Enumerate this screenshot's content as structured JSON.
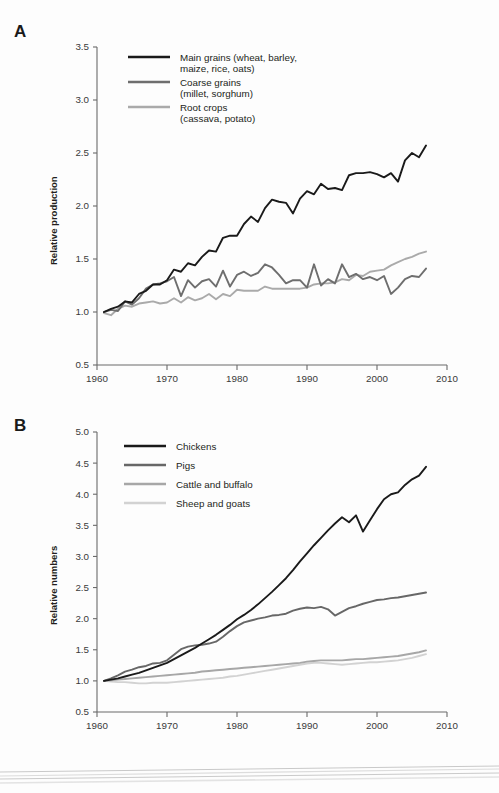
{
  "figure": {
    "background_color": "#fdfdfd",
    "panels": [
      "A",
      "B"
    ]
  },
  "panel_a": {
    "letter": "A",
    "y_axis_label": "Relative production",
    "legend_entries": [
      {
        "label_line1": "Main grains (wheat, barley,",
        "label_line2": "maize, rice, oats)",
        "color": "#1a1a1a"
      },
      {
        "label_line1": "Coarse grains",
        "label_line2": "(millet, sorghum)",
        "color": "#6e6e6e"
      },
      {
        "label_line1": "Root crops",
        "label_line2": "(cassava, potato)",
        "color": "#aaaaaa"
      }
    ]
  },
  "panel_b": {
    "letter": "B",
    "y_axis_label": "Relative numbers",
    "legend_entries": [
      {
        "label": "Chickens",
        "color": "#1a1a1a"
      },
      {
        "label": "Pigs",
        "color": "#676767"
      },
      {
        "label": "Cattle and buffalo",
        "color": "#a7a7a7"
      },
      {
        "label": "Sheep and goats",
        "color": "#d2d2d2"
      }
    ]
  },
  "chart_data": [
    {
      "type": "line",
      "id": "panel-a",
      "title": "",
      "xlabel": "",
      "ylabel": "Relative production",
      "xlim": [
        1960,
        2010
      ],
      "ylim": [
        0.5,
        3.5
      ],
      "xticks": [
        1960,
        1970,
        1980,
        1990,
        2000,
        2010
      ],
      "yticks": [
        0.5,
        1.0,
        1.5,
        2.0,
        2.5,
        3.0,
        3.5
      ],
      "xtick_labels": [
        "1960",
        "1970",
        "1980",
        "1990",
        "2000",
        "2010"
      ],
      "ytick_labels": [
        "0.5",
        "1.0",
        "1.5",
        "2.0",
        "2.5",
        "3.0",
        "3.5"
      ],
      "grid": false,
      "legend_position": "upper-left-inside",
      "x": [
        1961,
        1962,
        1963,
        1964,
        1965,
        1966,
        1967,
        1968,
        1969,
        1970,
        1971,
        1972,
        1973,
        1974,
        1975,
        1976,
        1977,
        1978,
        1979,
        1980,
        1981,
        1982,
        1983,
        1984,
        1985,
        1986,
        1987,
        1988,
        1989,
        1990,
        1991,
        1992,
        1993,
        1994,
        1995,
        1996,
        1997,
        1998,
        1999,
        2000,
        2001,
        2002,
        2003,
        2004,
        2005,
        2006,
        2007
      ],
      "series": [
        {
          "name": "Main grains (wheat, barley, maize, rice, oats)",
          "color": "#1a1a1a",
          "values": [
            1.0,
            1.03,
            1.05,
            1.1,
            1.09,
            1.17,
            1.2,
            1.26,
            1.26,
            1.3,
            1.4,
            1.38,
            1.46,
            1.44,
            1.52,
            1.58,
            1.57,
            1.7,
            1.72,
            1.72,
            1.83,
            1.9,
            1.85,
            1.98,
            2.06,
            2.04,
            2.03,
            1.93,
            2.07,
            2.14,
            2.11,
            2.21,
            2.16,
            2.17,
            2.15,
            2.29,
            2.31,
            2.31,
            2.32,
            2.3,
            2.27,
            2.31,
            2.23,
            2.43,
            2.5,
            2.46,
            2.57
          ]
        },
        {
          "name": "Coarse grains (millet, sorghum)",
          "color": "#6e6e6e",
          "values": [
            1.0,
            1.02,
            1.01,
            1.1,
            1.07,
            1.13,
            1.22,
            1.26,
            1.27,
            1.29,
            1.33,
            1.15,
            1.3,
            1.23,
            1.29,
            1.31,
            1.24,
            1.39,
            1.24,
            1.35,
            1.38,
            1.34,
            1.37,
            1.45,
            1.42,
            1.35,
            1.27,
            1.3,
            1.3,
            1.23,
            1.45,
            1.25,
            1.31,
            1.27,
            1.45,
            1.33,
            1.36,
            1.31,
            1.33,
            1.3,
            1.34,
            1.17,
            1.23,
            1.31,
            1.34,
            1.33,
            1.41
          ]
        },
        {
          "name": "Root crops (cassava, potato)",
          "color": "#aaaaaa",
          "values": [
            0.99,
            0.97,
            1.03,
            1.06,
            1.05,
            1.08,
            1.09,
            1.1,
            1.08,
            1.09,
            1.13,
            1.09,
            1.14,
            1.11,
            1.13,
            1.17,
            1.12,
            1.17,
            1.15,
            1.21,
            1.2,
            1.2,
            1.2,
            1.24,
            1.22,
            1.22,
            1.22,
            1.22,
            1.22,
            1.23,
            1.26,
            1.27,
            1.27,
            1.28,
            1.31,
            1.3,
            1.35,
            1.34,
            1.38,
            1.39,
            1.4,
            1.44,
            1.47,
            1.5,
            1.52,
            1.55,
            1.57
          ]
        }
      ]
    },
    {
      "type": "line",
      "id": "panel-b",
      "title": "",
      "xlabel": "",
      "ylabel": "Relative numbers",
      "xlim": [
        1960,
        2010
      ],
      "ylim": [
        0.5,
        5.0
      ],
      "xticks": [
        1960,
        1970,
        1980,
        1990,
        2000,
        2010
      ],
      "yticks": [
        0.5,
        1.0,
        1.5,
        2.0,
        2.5,
        3.0,
        3.5,
        4.0,
        4.5,
        5.0
      ],
      "xtick_labels": [
        "1960",
        "1970",
        "1980",
        "1990",
        "2000",
        "2010"
      ],
      "ytick_labels": [
        "0.5",
        "1.0",
        "1.5",
        "2.0",
        "2.5",
        "3.0",
        "3.5",
        "4.0",
        "4.5",
        "5.0"
      ],
      "grid": false,
      "legend_position": "upper-left-inside",
      "x": [
        1961,
        1962,
        1963,
        1964,
        1965,
        1966,
        1967,
        1968,
        1969,
        1970,
        1971,
        1972,
        1973,
        1974,
        1975,
        1976,
        1977,
        1978,
        1979,
        1980,
        1981,
        1982,
        1983,
        1984,
        1985,
        1986,
        1987,
        1988,
        1989,
        1990,
        1991,
        1992,
        1993,
        1994,
        1995,
        1996,
        1997,
        1998,
        1999,
        2000,
        2001,
        2002,
        2003,
        2004,
        2005,
        2006,
        2007
      ],
      "series": [
        {
          "name": "Chickens",
          "color": "#1a1a1a",
          "values": [
            1.0,
            1.02,
            1.04,
            1.07,
            1.1,
            1.13,
            1.17,
            1.21,
            1.25,
            1.29,
            1.35,
            1.41,
            1.47,
            1.53,
            1.6,
            1.67,
            1.74,
            1.82,
            1.9,
            1.99,
            2.06,
            2.14,
            2.23,
            2.33,
            2.43,
            2.54,
            2.65,
            2.78,
            2.92,
            3.05,
            3.18,
            3.3,
            3.42,
            3.53,
            3.63,
            3.55,
            3.66,
            3.4,
            3.58,
            3.76,
            3.92,
            4.0,
            4.03,
            4.15,
            4.24,
            4.3,
            4.44
          ]
        },
        {
          "name": "Pigs",
          "color": "#676767",
          "values": [
            1.0,
            1.04,
            1.09,
            1.15,
            1.18,
            1.22,
            1.24,
            1.28,
            1.29,
            1.33,
            1.42,
            1.51,
            1.55,
            1.57,
            1.58,
            1.6,
            1.63,
            1.71,
            1.8,
            1.88,
            1.94,
            1.97,
            2.0,
            2.02,
            2.05,
            2.06,
            2.08,
            2.13,
            2.16,
            2.18,
            2.17,
            2.19,
            2.15,
            2.05,
            2.11,
            2.17,
            2.2,
            2.24,
            2.27,
            2.3,
            2.31,
            2.33,
            2.34,
            2.36,
            2.38,
            2.4,
            2.42
          ]
        },
        {
          "name": "Cattle and buffalo",
          "color": "#a7a7a7",
          "values": [
            1.0,
            1.01,
            1.02,
            1.03,
            1.04,
            1.05,
            1.06,
            1.07,
            1.08,
            1.09,
            1.1,
            1.11,
            1.12,
            1.13,
            1.15,
            1.16,
            1.17,
            1.18,
            1.19,
            1.2,
            1.21,
            1.22,
            1.23,
            1.24,
            1.25,
            1.26,
            1.27,
            1.28,
            1.29,
            1.31,
            1.32,
            1.33,
            1.33,
            1.33,
            1.33,
            1.34,
            1.35,
            1.35,
            1.36,
            1.37,
            1.38,
            1.39,
            1.4,
            1.42,
            1.44,
            1.46,
            1.49
          ]
        },
        {
          "name": "Sheep and goats",
          "color": "#d2d2d2",
          "values": [
            1.0,
            0.99,
            0.98,
            0.98,
            0.97,
            0.96,
            0.96,
            0.97,
            0.97,
            0.97,
            0.98,
            0.99,
            1.0,
            1.01,
            1.02,
            1.03,
            1.04,
            1.05,
            1.07,
            1.08,
            1.1,
            1.12,
            1.14,
            1.16,
            1.18,
            1.2,
            1.22,
            1.24,
            1.26,
            1.28,
            1.29,
            1.29,
            1.28,
            1.27,
            1.26,
            1.27,
            1.28,
            1.29,
            1.3,
            1.3,
            1.31,
            1.32,
            1.33,
            1.35,
            1.37,
            1.4,
            1.43
          ]
        }
      ]
    }
  ]
}
